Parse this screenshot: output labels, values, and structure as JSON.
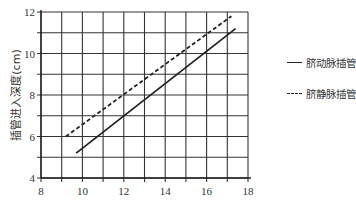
{
  "chart_data": {
    "type": "line",
    "title": "",
    "xlabel": "",
    "ylabel": "插管进入深度(cm)",
    "xlim": [
      8,
      18
    ],
    "ylim": [
      4,
      12
    ],
    "x_ticks": [
      8,
      10,
      12,
      14,
      16,
      18
    ],
    "y_ticks": [
      4,
      6,
      8,
      10,
      12
    ],
    "grid": true,
    "grid_step": {
      "x": 1,
      "y": 1
    },
    "legend_position": "right",
    "series": [
      {
        "name": "脐动脉插管",
        "style": "solid",
        "color": "#222222",
        "x": [
          9.7,
          17.4
        ],
        "y": [
          5.2,
          11.2
        ]
      },
      {
        "name": "脐静脉插管",
        "style": "dashed",
        "color": "#222222",
        "x": [
          9.2,
          17.2
        ],
        "y": [
          6.0,
          11.8
        ]
      }
    ]
  },
  "legend": {
    "items": [
      {
        "label": "脐动脉插管",
        "style": "solid"
      },
      {
        "label": "脐静脉插管",
        "style": "dashed"
      }
    ]
  },
  "axes": {
    "ylabel": "插管进入深度(cm)"
  }
}
